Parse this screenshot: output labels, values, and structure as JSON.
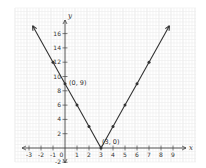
{
  "chart_data": {
    "type": "line",
    "title": "",
    "xlabel": "x",
    "ylabel": "y",
    "xlim": [
      -3.5,
      9.5
    ],
    "ylim": [
      -3,
      18
    ],
    "grid": true,
    "x_ticks": [
      -3,
      -2,
      -1,
      0,
      1,
      2,
      3,
      4,
      5,
      6,
      7,
      8,
      9
    ],
    "y_ticks": [
      -2,
      2,
      4,
      6,
      8,
      10,
      12,
      14,
      16
    ],
    "x_tick_labels": [
      "-3",
      "-2",
      "-1",
      "0",
      "1",
      "2",
      "3",
      "4",
      "5",
      "6",
      "7",
      "8",
      "9"
    ],
    "y_tick_labels": [
      "-2",
      "2",
      "4",
      "6",
      "8",
      "10",
      "12",
      "14",
      "16"
    ],
    "series": [
      {
        "name": "y = 3|x - 3|",
        "x": [
          -2.7,
          -1,
          0,
          1,
          2,
          3,
          4,
          5,
          6,
          7,
          8.7
        ],
        "y": [
          17.1,
          12,
          9,
          6,
          3,
          0,
          3,
          6,
          9,
          12,
          17.1
        ],
        "markers": [
          [
            -1,
            12
          ],
          [
            0,
            9
          ],
          [
            1,
            6
          ],
          [
            2,
            3
          ],
          [
            3,
            0
          ],
          [
            4,
            3
          ],
          [
            5,
            6
          ],
          [
            6,
            9
          ],
          [
            7,
            12
          ]
        ],
        "arrows_at_ends": true,
        "color": "#333333"
      }
    ],
    "annotations": [
      {
        "text": "(0, 9)",
        "x": 0,
        "y": 9
      },
      {
        "text": "(3, 0)",
        "x": 3,
        "y": 0
      }
    ]
  },
  "labels": {
    "x_axis": "x",
    "y_axis": "y",
    "point_a": "(0, 9)",
    "point_b": "(3, 0)"
  },
  "colors": {
    "grid_minor": "#ececec",
    "grid_major": "#dcdcdc",
    "axis": "#444444",
    "line": "#333333"
  }
}
